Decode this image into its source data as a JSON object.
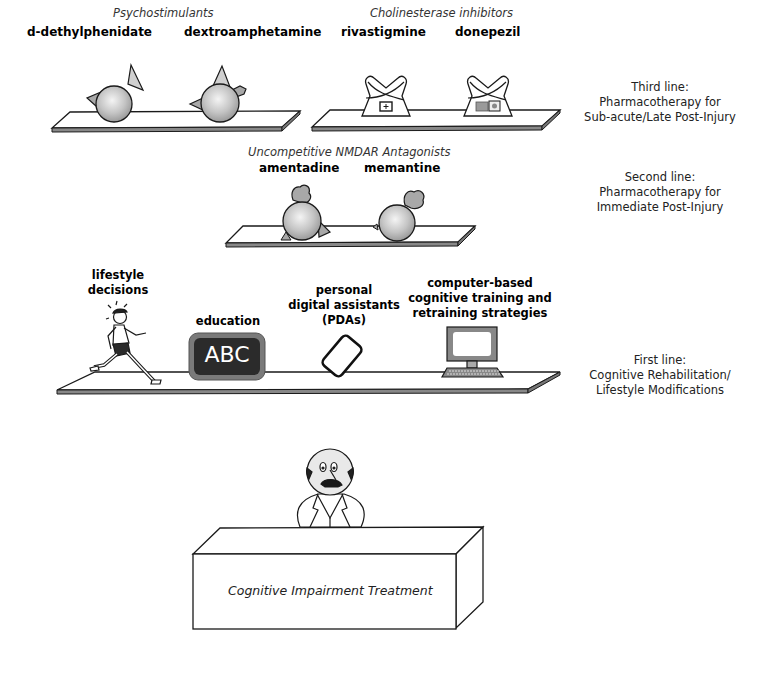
{
  "diagram": {
    "title": "Cognitive Impairment Treatment",
    "tiers": [
      {
        "id": "third_line",
        "note_lines": [
          "Third line:",
          "Pharmacotherapy for",
          "Sub-acute/Late Post-Injury"
        ],
        "groups": [
          {
            "category": "Psychostimulants",
            "drugs": [
              "d-dethylphenidate",
              "dextroamphetamine"
            ]
          },
          {
            "category": "Cholinesterase inhibitors",
            "drugs": [
              "rivastigmine",
              "donepezil"
            ]
          }
        ]
      },
      {
        "id": "second_line",
        "note_lines": [
          "Second line:",
          "Pharmacotherapy for",
          "Immediate Post-Injury"
        ],
        "groups": [
          {
            "category": "Uncompetitive NMDAR Antagonists",
            "drugs": [
              "amentadine",
              "memantine"
            ]
          }
        ]
      },
      {
        "id": "first_line",
        "note_lines": [
          "First line:",
          "Cognitive Rehabilitation/",
          "Lifestyle Modifications"
        ],
        "items": [
          {
            "label_lines": [
              "lifestyle",
              "decisions"
            ],
            "icon": "runner-icon"
          },
          {
            "label_lines": [
              "education"
            ],
            "icon": "blackboard-icon",
            "board_text": "ABC"
          },
          {
            "label_lines": [
              "personal",
              "digital assistants",
              "(PDAs)"
            ],
            "icon": "pda-icon"
          },
          {
            "label_lines": [
              "computer-based",
              "cognitive training and",
              "retraining strategies"
            ],
            "icon": "computer-icon"
          }
        ]
      }
    ],
    "desk_label": "Cognitive Impairment Treatment",
    "colors": {
      "outline": "#1a1a1a",
      "sphere_fill": "#c8c8c8",
      "accent_gray": "#a8a8a8",
      "board_fill": "#2b2b2b",
      "board_border": "#7a7a7a"
    }
  }
}
